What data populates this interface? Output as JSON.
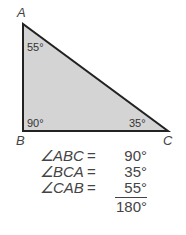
{
  "diagram": {
    "type": "right-triangle",
    "fill_color": "#d4d4d4",
    "stroke_color": "#222222",
    "vertices": {
      "A": {
        "label": "A",
        "angle": "55°"
      },
      "B": {
        "label": "B",
        "angle": "90°"
      },
      "C": {
        "label": "C",
        "angle": "35°"
      }
    }
  },
  "equations": [
    {
      "name": "∠ABC",
      "eq": "=",
      "value": "90°"
    },
    {
      "name": "∠BCA",
      "eq": "=",
      "value": "35°"
    },
    {
      "name": "∠CAB",
      "eq": "=",
      "value": "55°"
    }
  ],
  "total": "180°"
}
